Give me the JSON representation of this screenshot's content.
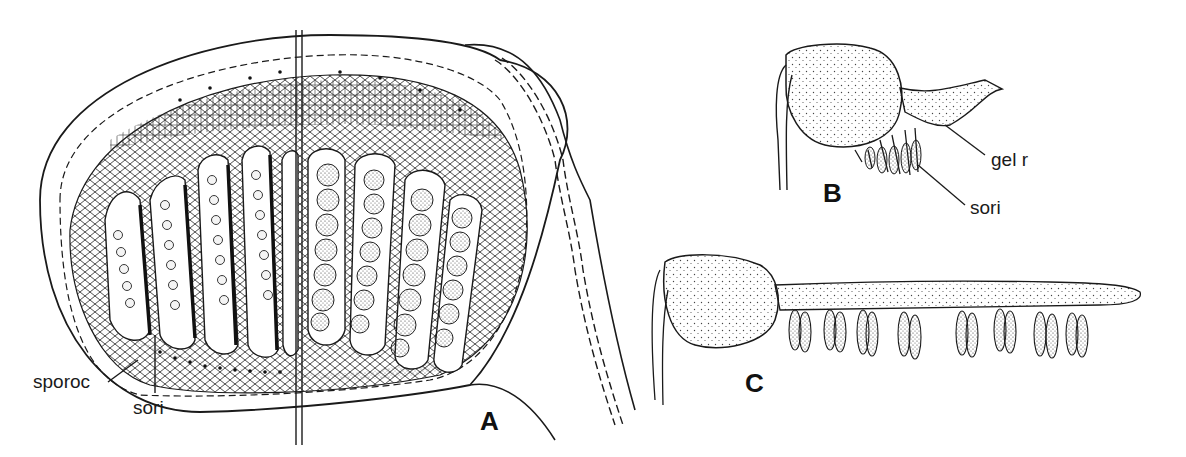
{
  "figure": {
    "panels": [
      {
        "id": "A",
        "letter": "A",
        "description": "Section through sporocarp showing sori in two halves",
        "labels": {
          "sporoc": "sporoc",
          "sori": "sori"
        }
      },
      {
        "id": "B",
        "letter": "B",
        "description": "Sporocarp with emerging gelatinous ring and sori",
        "labels": {
          "gel_r": "gel r",
          "sori": "sori"
        }
      },
      {
        "id": "C",
        "letter": "C",
        "description": "Sporocarp with fully extended gelatinous ring bearing sori",
        "sori_count": 8
      }
    ],
    "colors": {
      "ink": "#1a1a1a",
      "paper": "#ffffff",
      "stipple": "#444444"
    }
  }
}
